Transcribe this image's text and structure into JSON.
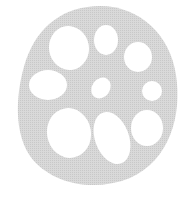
{
  "illustration": {
    "subject": "lotus root cross-section",
    "body_color": "#d4d4d4",
    "hole_color": "#ffffff",
    "holes": [
      {
        "cx": 69,
        "cy": 48,
        "rx": 20,
        "ry": 22,
        "rot": -10
      },
      {
        "cx": 106,
        "cy": 40,
        "rx": 12,
        "ry": 15,
        "rot": 0
      },
      {
        "cx": 138,
        "cy": 57,
        "rx": 14,
        "ry": 15,
        "rot": 0
      },
      {
        "cx": 48,
        "cy": 85,
        "rx": 19,
        "ry": 15,
        "rot": 0
      },
      {
        "cx": 101,
        "cy": 88,
        "rx": 9,
        "ry": 11,
        "rot": 35
      },
      {
        "cx": 152,
        "cy": 91,
        "rx": 10,
        "ry": 10,
        "rot": 0
      },
      {
        "cx": 69,
        "cy": 133,
        "rx": 22,
        "ry": 25,
        "rot": -10
      },
      {
        "cx": 112,
        "cy": 138,
        "rx": 17,
        "ry": 27,
        "rot": -20
      },
      {
        "cx": 147,
        "cy": 128,
        "rx": 16,
        "ry": 18,
        "rot": 0
      }
    ]
  }
}
